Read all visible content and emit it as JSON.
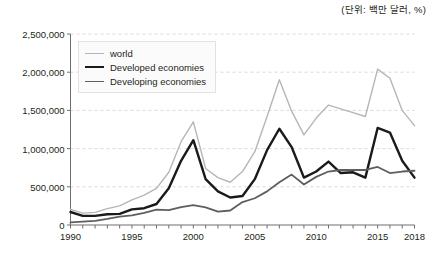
{
  "unit_note": "(단위: 백만 달러, %)",
  "legend": {
    "position": "top-left-inside",
    "items": [
      {
        "label": "world",
        "color": "#b6b6b6",
        "width": 1.4
      },
      {
        "label": "Developed economies",
        "color": "#1a1a1a",
        "width": 2.4
      },
      {
        "label": "Developing economies",
        "color": "#5e5e5e",
        "width": 1.8
      }
    ]
  },
  "axes": {
    "y_ticks": [
      "0",
      "500,000",
      "1,000,000",
      "1,500,000",
      "2,000,000",
      "2,500,000"
    ],
    "x_ticks": [
      "1990",
      "1995",
      "2000",
      "2005",
      "2010",
      "2015",
      "2018"
    ]
  },
  "chart_data": {
    "type": "line",
    "title": "",
    "subtitle": "",
    "xlabel": "",
    "ylabel": "",
    "unit": "(단위: 백만 달러, %)",
    "grid": true,
    "legend_position": "top-left-inside",
    "xlim": [
      1990,
      2018
    ],
    "ylim": [
      0,
      2500000
    ],
    "y_tick_values": [
      0,
      500000,
      1000000,
      1500000,
      2000000,
      2500000
    ],
    "x_tick_values": [
      1990,
      1995,
      2000,
      2005,
      2010,
      2015,
      2018
    ],
    "x": [
      1990,
      1991,
      1992,
      1993,
      1994,
      1995,
      1996,
      1997,
      1998,
      1999,
      2000,
      2001,
      2002,
      2003,
      2004,
      2005,
      2006,
      2007,
      2008,
      2009,
      2010,
      2011,
      2012,
      2013,
      2014,
      2015,
      2016,
      2017,
      2018
    ],
    "series": [
      {
        "name": "world",
        "color": "#b6b6b6",
        "values": [
          205000,
          155000,
          165000,
          215000,
          250000,
          330000,
          390000,
          480000,
          690000,
          1090000,
          1350000,
          740000,
          620000,
          560000,
          700000,
          960000,
          1420000,
          1900000,
          1490000,
          1180000,
          1400000,
          1570000,
          1520000,
          1470000,
          1420000,
          2040000,
          1920000,
          1500000,
          1300000
        ]
      },
      {
        "name": "Developed economies",
        "color": "#1a1a1a",
        "values": [
          170000,
          120000,
          120000,
          140000,
          145000,
          205000,
          220000,
          275000,
          480000,
          840000,
          1110000,
          600000,
          440000,
          360000,
          380000,
          600000,
          980000,
          1260000,
          1020000,
          620000,
          700000,
          830000,
          680000,
          690000,
          620000,
          1270000,
          1210000,
          840000,
          620000
        ]
      },
      {
        "name": "Developing economies",
        "color": "#5e5e5e",
        "values": [
          35000,
          45000,
          55000,
          80000,
          110000,
          125000,
          160000,
          200000,
          195000,
          235000,
          260000,
          230000,
          175000,
          190000,
          300000,
          350000,
          440000,
          560000,
          660000,
          530000,
          630000,
          700000,
          720000,
          720000,
          720000,
          760000,
          680000,
          700000,
          710000
        ]
      }
    ]
  }
}
